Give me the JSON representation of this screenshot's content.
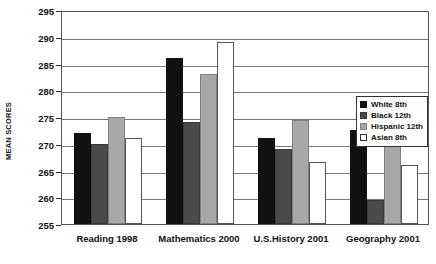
{
  "chart_data": {
    "type": "bar",
    "title": "",
    "subtitle": "",
    "xlabel": "",
    "ylabel": "MEAN SCORES",
    "ylim": [
      255,
      295
    ],
    "ytick_values": [
      255,
      260,
      265,
      270,
      275,
      280,
      285,
      290,
      295
    ],
    "ytick_labels": [
      "255",
      "260",
      "265",
      "270",
      "275",
      "280",
      "285",
      "290",
      "295"
    ],
    "grid": "horizontal",
    "legend_position": "upper-right-inside",
    "categories": [
      "Reading 1998",
      "Mathematics 2000",
      "U.S.History 2001",
      "Geography 2001"
    ],
    "series": [
      {
        "name": "White 8th",
        "color": "#111111",
        "values": [
          272.0,
          286.0,
          271.0,
          272.5
        ]
      },
      {
        "name": "Black 12th",
        "color": "#4a4a4a",
        "values": [
          270.0,
          274.0,
          269.0,
          259.5
        ]
      },
      {
        "name": "Hispanic 12th",
        "color": "#a8a8a8",
        "values": [
          275.0,
          283.0,
          274.5,
          269.5
        ]
      },
      {
        "name": "Asian 8th",
        "color": "#ffffff",
        "values": [
          271.0,
          289.0,
          266.5,
          266.0
        ]
      }
    ],
    "annotations": []
  },
  "legend": {
    "items": [
      {
        "label": "White 8th"
      },
      {
        "label": "Black 12th"
      },
      {
        "label": "Hispanic 12th"
      },
      {
        "label": "Asian 8th"
      }
    ]
  }
}
